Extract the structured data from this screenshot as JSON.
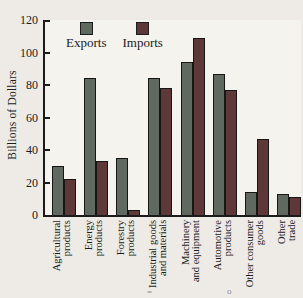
{
  "figure": {
    "background": "#eeebe6",
    "plot_background": "#f5f3ee",
    "axis_color": "#1b1b1b"
  },
  "chart_data": {
    "type": "bar",
    "title": "",
    "xlabel": "",
    "ylabel": "Billions of Dollars",
    "ylim": [
      0,
      120
    ],
    "ytick_step": 20,
    "grid": false,
    "legend_position": "top-left-inside",
    "categories": [
      [
        "Agricultural",
        "products"
      ],
      [
        "Energy",
        "products"
      ],
      [
        "Forestry",
        "products"
      ],
      [
        "Industrial goods",
        "and materials"
      ],
      [
        "Machinery",
        "and equipment"
      ],
      [
        "Automotive",
        "products"
      ],
      [
        "Other consumer",
        "goods"
      ],
      [
        "Other",
        "trade"
      ]
    ],
    "series": [
      {
        "name": "Exports",
        "color": "#5f6960",
        "values": [
          30,
          84,
          35,
          84,
          94,
          87,
          14,
          13
        ]
      },
      {
        "name": "Imports",
        "color": "#5e3738",
        "values": [
          22,
          33,
          3,
          78,
          109,
          77,
          47,
          11
        ]
      }
    ]
  },
  "stray_marks": {
    "left": "=",
    "right": "o"
  }
}
